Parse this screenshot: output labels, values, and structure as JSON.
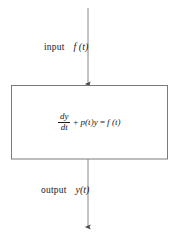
{
  "diagram": {
    "type": "block-diagram",
    "background_color": "#ffffff",
    "line_color": "#6e6e6e",
    "text_color": "#1a1a1a",
    "input": {
      "word": "input",
      "symbol": "f (t)"
    },
    "output": {
      "word": "output",
      "symbol": "y(t)"
    },
    "block": {
      "equation": {
        "fraction_numerator": "dy",
        "fraction_denominator": "dt",
        "operator": "+",
        "second_term": "p(t)y",
        "equals": "=",
        "right_side": "f (t)",
        "plain_text": "dy/dt + p(t)y = f (t)"
      }
    },
    "arrows": [
      {
        "name": "input-arrow",
        "direction": "down",
        "from_y": 8,
        "to_y": 85,
        "x": 88
      },
      {
        "name": "output-arrow",
        "direction": "down",
        "from_y": 159,
        "to_y": 228,
        "x": 88
      }
    ]
  }
}
